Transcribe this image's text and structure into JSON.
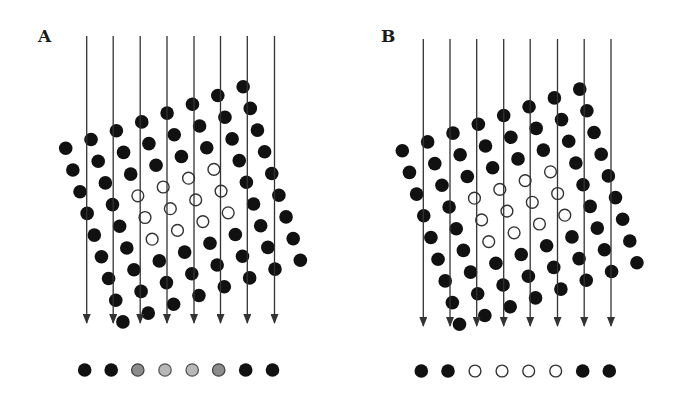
{
  "figure": {
    "colors": {
      "line": "#333333",
      "filled_atom": "#111111",
      "hollow_atom_stroke": "#333333",
      "projection_dark_gray": "#8c8c8c",
      "projection_light_gray": "#b8b8b8"
    },
    "lattice": {
      "columns": 8,
      "rows": 9,
      "column_step": [
        25.35,
        -8.8
      ],
      "row_step": [
        7.15,
        21.7
      ],
      "hollow_region": {
        "columns": [
          2,
          3,
          4,
          5
        ],
        "rows": [
          3,
          4,
          5
        ]
      },
      "dot_radius": 6.8
    },
    "panels": [
      {
        "label": "A",
        "label_pos": [
          38,
          42
        ],
        "lattice_origin": [
          65.7,
          148.3
        ],
        "ray_x": [
          86.7,
          113.2,
          140.2,
          167.0,
          194.0,
          220.5,
          247.3,
          274.5
        ],
        "ray_top": 36,
        "ray_bottom": 333,
        "projection_y": 370,
        "projection_x": [
          84.7,
          111.2,
          137.8,
          165.0,
          192.2,
          218.7,
          245.7,
          272.5
        ],
        "projection": [
          "black",
          "black",
          "dark-gray",
          "light-gray",
          "light-gray",
          "dark-gray",
          "black",
          "black"
        ]
      },
      {
        "label": "B",
        "label_pos": [
          381,
          42
        ],
        "lattice_origin": [
          402.3,
          150.7
        ],
        "ray_x": [
          423.3,
          450.0,
          476.7,
          503.7,
          530.2,
          557.5,
          584.2,
          611.0
        ],
        "ray_top": 39,
        "ray_bottom": 336,
        "projection_y": 371,
        "projection_x": [
          421.3,
          448.0,
          475.0,
          502.0,
          528.7,
          555.7,
          582.7,
          609.3
        ],
        "projection": [
          "black",
          "black",
          "hollow",
          "hollow",
          "hollow",
          "hollow",
          "black",
          "black"
        ]
      }
    ]
  }
}
